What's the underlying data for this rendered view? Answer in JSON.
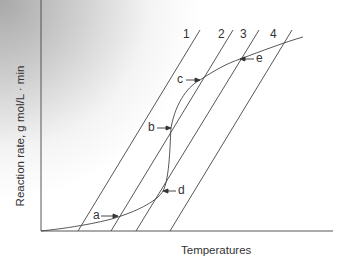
{
  "figure": {
    "y_axis_label": "Reaction rate, g mol/L · min",
    "x_axis_label": "Temperatures",
    "line_labels": [
      "1",
      "2",
      "3",
      "4"
    ],
    "point_labels": [
      "a",
      "b",
      "c",
      "d",
      "e"
    ]
  },
  "colors": {
    "line": "#333333",
    "background_gradient": "#a8a8a8"
  }
}
